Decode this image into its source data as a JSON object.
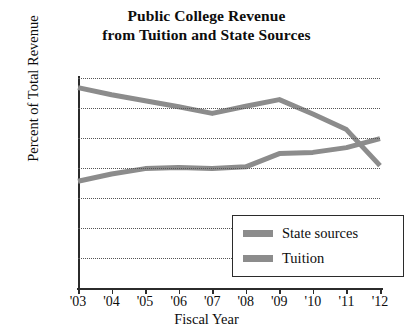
{
  "chart_data": {
    "type": "line",
    "title": "Public College Revenue from Tuition and State Sources",
    "title_lines": [
      "Public College Revenue",
      "from Tuition and State Sources"
    ],
    "xlabel": "Fiscal Year",
    "ylabel": "Percent of Total Revenue",
    "categories": [
      "'03",
      "'04",
      "'05",
      "'06",
      "'07",
      "'08",
      "'09",
      "'10",
      "'11",
      "'12"
    ],
    "x_values": [
      2003,
      2004,
      2005,
      2006,
      2007,
      2008,
      2009,
      2010,
      2011,
      2012
    ],
    "ylim": [
      0,
      35
    ],
    "yticks": [
      0,
      5,
      10,
      15,
      20,
      25,
      30,
      35
    ],
    "ytick_labels": [
      "0",
      "5",
      "10",
      "15",
      "20",
      "25",
      "30",
      "35"
    ],
    "grid": "horizontal-dotted",
    "legend_position": "lower-right-inside",
    "series": [
      {
        "name": "State sources",
        "color": "#8c8c8c",
        "values": [
          33.4,
          32.2,
          31.2,
          30.2,
          29.1,
          30.3,
          31.4,
          29.0,
          26.4,
          20.4
        ]
      },
      {
        "name": "Tuition",
        "color": "#8c8c8c",
        "values": [
          17.8,
          19.0,
          19.9,
          20.1,
          19.9,
          20.2,
          22.4,
          22.6,
          23.4,
          24.9
        ]
      }
    ],
    "annotations": []
  },
  "legend": {
    "items": [
      {
        "label": "State sources"
      },
      {
        "label": "Tuition"
      }
    ]
  },
  "colors": {
    "line": "#8c8c8c",
    "axis": "#2b2b2b",
    "grid": "#555555",
    "text": "#0d0d0d",
    "background": "#ffffff"
  }
}
